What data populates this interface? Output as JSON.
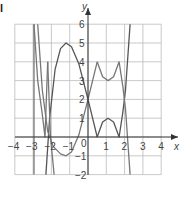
{
  "corner_label": "l",
  "chart_data": {
    "type": "line",
    "title": "",
    "xlabel": "x",
    "ylabel": "y",
    "xlim": [
      -4,
      4
    ],
    "ylim": [
      -2,
      6
    ],
    "grid": true,
    "x_ticks": [
      "-4",
      "-3",
      "-2",
      "-1",
      "1",
      "2",
      "3",
      "4"
    ],
    "y_ticks": [
      "-2",
      "-1",
      "1",
      "2",
      "3",
      "4",
      "5",
      "6"
    ],
    "origin_label": "0",
    "series": [
      {
        "name": "curve-arch",
        "color": "#555555",
        "points": [
          [
            -2.3,
            -2
          ],
          [
            -2.1,
            1
          ],
          [
            -1.8,
            3.6
          ],
          [
            -1.5,
            4.7
          ],
          [
            -1.2,
            5
          ],
          [
            -0.9,
            4.8
          ],
          [
            -0.5,
            3.9
          ],
          [
            0,
            2
          ],
          [
            0.25,
            1
          ],
          [
            0.5,
            0
          ]
        ]
      },
      {
        "name": "curve-trough",
        "color": "#777777",
        "points": [
          [
            -2.75,
            6
          ],
          [
            -2.5,
            2.5
          ],
          [
            -2.2,
            0.3
          ],
          [
            -1.9,
            -0.5
          ],
          [
            -1.5,
            -0.9
          ],
          [
            -1.2,
            -1
          ],
          [
            -0.9,
            -0.8
          ],
          [
            -0.5,
            0.1
          ],
          [
            0,
            2
          ],
          [
            0.25,
            3
          ],
          [
            0.5,
            4
          ]
        ]
      },
      {
        "name": "curve-abs-lower",
        "color": "#555555",
        "points": [
          [
            0.5,
            0
          ],
          [
            0.8,
            0.8
          ],
          [
            1.1,
            1
          ],
          [
            1.4,
            0.8
          ],
          [
            1.7,
            0
          ],
          [
            1.9,
            1.3
          ],
          [
            2.05,
            2.5
          ],
          [
            2.3,
            6
          ]
        ]
      },
      {
        "name": "curve-abs-upper",
        "color": "#777777",
        "points": [
          [
            0.5,
            4
          ],
          [
            0.8,
            3.2
          ],
          [
            1.1,
            3
          ],
          [
            1.4,
            3.2
          ],
          [
            1.7,
            4
          ],
          [
            1.9,
            2.7
          ],
          [
            2.05,
            1.5
          ],
          [
            2.3,
            -2
          ]
        ]
      },
      {
        "name": "curve-left-spike-a",
        "color": "#777777",
        "points": [
          [
            -2.95,
            6
          ],
          [
            -2.75,
            3
          ],
          [
            -2.5,
            1.2
          ],
          [
            -2.35,
            0
          ],
          [
            -2.2,
            4
          ]
        ]
      },
      {
        "name": "curve-left-spike-b",
        "color": "#777777",
        "points": [
          [
            -2.2,
            4
          ],
          [
            -2.05,
            0
          ],
          [
            -1.95,
            -1
          ],
          [
            -1.85,
            -2
          ]
        ]
      },
      {
        "name": "curve-left-vertical",
        "color": "#777777",
        "points": [
          [
            -2.95,
            6
          ],
          [
            -2.95,
            -2
          ]
        ]
      }
    ]
  }
}
